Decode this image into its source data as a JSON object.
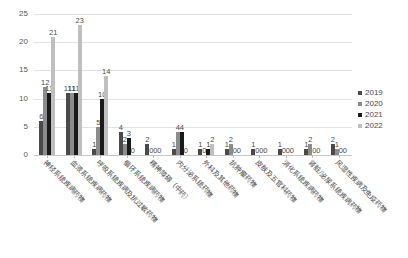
{
  "chart_data": {
    "type": "bar",
    "title": "",
    "xlabel": "",
    "ylabel": "",
    "ylim": [
      0,
      25
    ],
    "yticks": [
      0,
      5,
      10,
      15,
      20,
      25
    ],
    "grid": true,
    "legend_position": "right",
    "categories": [
      "神经系统疾病药物",
      "血液系统疾病药物",
      "呼吸系统疾病及抗过敏药物",
      "循环系统疾病药物",
      "精神障碍（中药）",
      "内分泌系统药物",
      "外科及其他药物",
      "抗肿瘤药物",
      "皮肤及五官科药物",
      "消化系统疾病药物",
      "肾脏/泌尿系统疾病药物",
      "风湿性疾病及免疫药物"
    ],
    "series": [
      {
        "name": "2019",
        "color": "#4a4a4a",
        "values": [
          6,
          11,
          1,
          4,
          2,
          1,
          1,
          1,
          1,
          1,
          1,
          2
        ]
      },
      {
        "name": "2020",
        "color": "#8c8c8c",
        "values": [
          12,
          11,
          5,
          2,
          0,
          4,
          0,
          2,
          0,
          0,
          2,
          1
        ]
      },
      {
        "name": "2021",
        "color": "#1a1a1a",
        "values": [
          11,
          11,
          10,
          3,
          0,
          4,
          1,
          0,
          0,
          0,
          0,
          0
        ]
      },
      {
        "name": "2022",
        "color": "#bfbfbf",
        "values": [
          21,
          23,
          14,
          0,
          0,
          0,
          2,
          0,
          0,
          0,
          0,
          0
        ]
      }
    ]
  },
  "legend": {
    "items": [
      {
        "label": "2019",
        "color": "#4a4a4a"
      },
      {
        "label": "2020",
        "color": "#8c8c8c"
      },
      {
        "label": "2021",
        "color": "#1a1a1a"
      },
      {
        "label": "2022",
        "color": "#bfbfbf"
      }
    ]
  }
}
